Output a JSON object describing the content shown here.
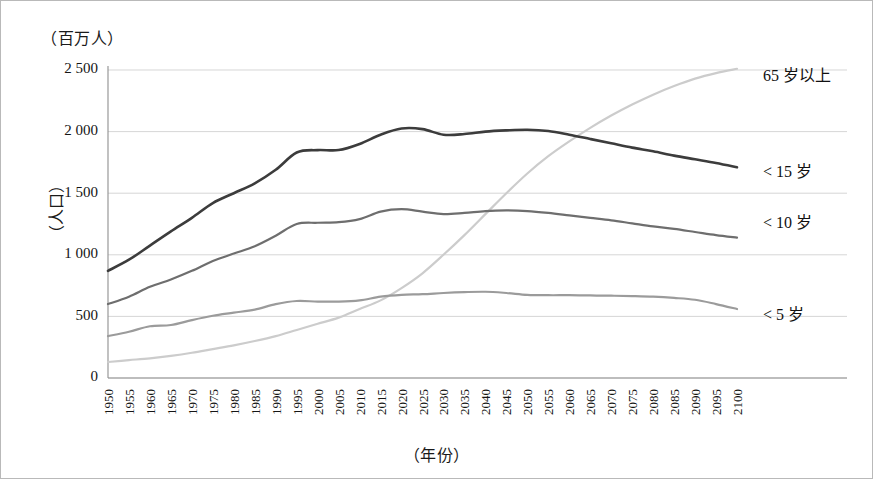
{
  "figure": {
    "y_unit_caption": "（百万人）",
    "y_axis_title": "（人口）",
    "x_axis_title": "（年份）"
  },
  "chart_data": {
    "type": "line",
    "title": "",
    "xlabel": "（年份）",
    "ylabel": "（人口）",
    "y_unit": "（百万人）",
    "xlim": [
      1950,
      2100
    ],
    "ylim": [
      0,
      2500
    ],
    "ytick_labels": [
      "0",
      "500",
      "1 000",
      "1 500",
      "2 000",
      "2 500"
    ],
    "yticks": [
      0,
      500,
      1000,
      1500,
      2000,
      2500
    ],
    "grid": "horizontal",
    "legend_position": "right-inline-labels",
    "x": [
      1950,
      1955,
      1960,
      1965,
      1970,
      1975,
      1980,
      1985,
      1990,
      1995,
      2000,
      2005,
      2010,
      2015,
      2020,
      2025,
      2030,
      2035,
      2040,
      2045,
      2050,
      2055,
      2060,
      2065,
      2070,
      2075,
      2080,
      2085,
      2090,
      2095,
      2100
    ],
    "xtick_labels": [
      "1950",
      "1955",
      "1960",
      "1965",
      "1970",
      "1975",
      "1980",
      "1985",
      "1990",
      "1995",
      "2000",
      "2005",
      "2010",
      "2015",
      "2020",
      "2025",
      "2030",
      "2035",
      "2040",
      "2045",
      "2050",
      "2055",
      "2060",
      "2065",
      "2070",
      "2075",
      "2080",
      "2085",
      "2090",
      "2095",
      "2100"
    ],
    "series": [
      {
        "name": "< 15 岁",
        "label": "< 15 岁",
        "color": "#3c3c3c",
        "width": 2.6,
        "values": [
          870,
          960,
          1075,
          1190,
          1300,
          1420,
          1500,
          1580,
          1690,
          1830,
          1850,
          1850,
          1900,
          1975,
          2025,
          2020,
          1975,
          1980,
          2000,
          2010,
          2015,
          2005,
          1975,
          1940,
          1905,
          1870,
          1840,
          1805,
          1775,
          1745,
          1710
        ]
      },
      {
        "name": "< 10 岁",
        "label": "< 10 岁",
        "color": "#6e6e6e",
        "width": 2.2,
        "values": [
          600,
          660,
          740,
          800,
          870,
          950,
          1010,
          1070,
          1155,
          1250,
          1260,
          1265,
          1290,
          1350,
          1370,
          1350,
          1330,
          1340,
          1355,
          1360,
          1355,
          1340,
          1320,
          1300,
          1280,
          1255,
          1230,
          1210,
          1185,
          1160,
          1140
        ]
      },
      {
        "name": "< 5 岁",
        "label": "< 5 岁",
        "color": "#9b9b9b",
        "width": 2.2,
        "values": [
          340,
          375,
          420,
          430,
          470,
          505,
          530,
          555,
          600,
          625,
          620,
          620,
          630,
          660,
          675,
          680,
          690,
          697,
          700,
          690,
          675,
          672,
          672,
          670,
          668,
          665,
          660,
          650,
          635,
          600,
          560
        ]
      },
      {
        "name": "65 岁以上",
        "label": "65 岁以上",
        "color": "#cccccc",
        "width": 2.2,
        "values": [
          130,
          145,
          160,
          180,
          205,
          235,
          265,
          300,
          340,
          390,
          440,
          490,
          560,
          630,
          730,
          850,
          1000,
          1160,
          1330,
          1500,
          1660,
          1800,
          1920,
          2030,
          2130,
          2220,
          2300,
          2370,
          2430,
          2475,
          2510
        ]
      }
    ],
    "series_label_positions": [
      {
        "name": "65 岁以上",
        "x": 762,
        "y": 76
      },
      {
        "name": "< 15 岁",
        "x": 762,
        "y": 172
      },
      {
        "name": "< 10 岁",
        "x": 762,
        "y": 223
      },
      {
        "name": "< 5 岁",
        "x": 762,
        "y": 315
      }
    ]
  }
}
